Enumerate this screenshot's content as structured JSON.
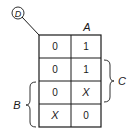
{
  "kmap": {
    "corner_variable": "D",
    "top_variable": "A",
    "left_variable": "B",
    "right_variable": "C",
    "cells": [
      [
        "0",
        "1"
      ],
      [
        "0",
        "1"
      ],
      [
        "0",
        "X"
      ],
      [
        "X",
        "0"
      ]
    ],
    "top_bracket_columns": [
      1
    ],
    "right_bracket_rows": [
      1,
      2
    ],
    "left_bracket_rows": [
      2,
      3
    ]
  },
  "colors": {
    "line": "#1a1a1a",
    "background": "#ffffff"
  }
}
